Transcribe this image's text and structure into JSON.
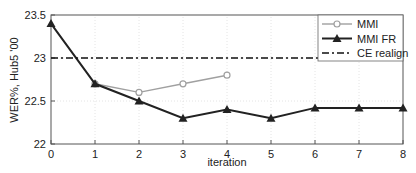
{
  "chart_data": {
    "type": "line",
    "title": "",
    "xlabel": "iteration",
    "ylabel": "WER%, Hub5 '00",
    "xlim": [
      0,
      8
    ],
    "ylim": [
      22,
      23.5
    ],
    "xticks": [
      "0",
      "1",
      "2",
      "3",
      "4",
      "5",
      "6",
      "7",
      "8"
    ],
    "yticks": [
      "22",
      "22.5",
      "23",
      "23.5"
    ],
    "grid": true,
    "legend_position": "upper right",
    "series": [
      {
        "name": "MMI",
        "color": "#a0a0a0",
        "marker": "circle",
        "x": [
          1,
          2,
          3,
          4
        ],
        "values": [
          22.7,
          22.6,
          22.7,
          22.8
        ]
      },
      {
        "name": "MMI FR",
        "color": "#222222",
        "marker": "triangle",
        "x": [
          0,
          1,
          2,
          3,
          4,
          5,
          6,
          7,
          8
        ],
        "values": [
          23.4,
          22.7,
          22.5,
          22.3,
          22.4,
          22.3,
          22.42,
          22.42,
          22.42
        ]
      },
      {
        "name": "CE realign",
        "color": "#111111",
        "style": "dash-dot",
        "x": [
          0,
          8
        ],
        "values": [
          23.0,
          23.0
        ]
      }
    ]
  }
}
